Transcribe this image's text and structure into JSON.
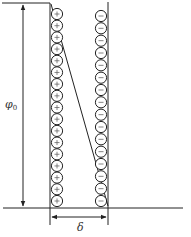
{
  "diagram": {
    "labels": {
      "potential": "φ",
      "potential_sub": "0",
      "thickness": "δ"
    },
    "left_layer": {
      "sign": "+",
      "count": 17
    },
    "right_layer": {
      "sign": "−",
      "count": 16
    },
    "colors": {
      "stroke": "#222222",
      "background": "#ffffff"
    }
  }
}
